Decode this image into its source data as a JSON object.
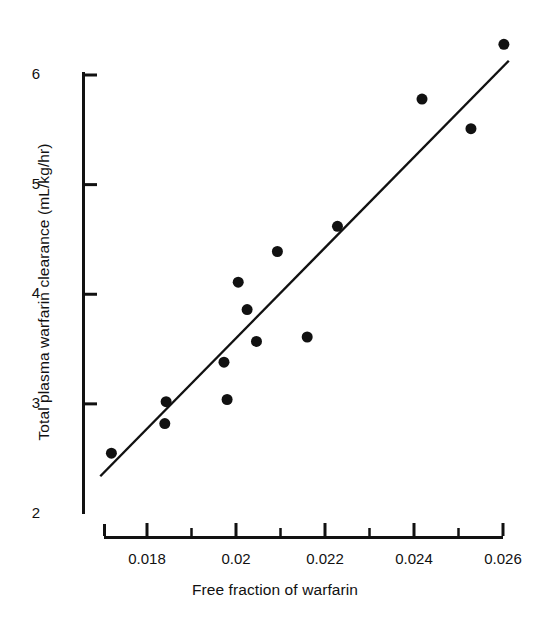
{
  "chart_data": {
    "type": "scatter",
    "title": "",
    "xlabel": "Free fraction of warfarin",
    "ylabel": "Total plasma warfarin clearance (mL/kg/hr)",
    "xlim": [
      0.0168,
      0.0262
    ],
    "ylim": [
      2.0,
      6.4
    ],
    "grid": false,
    "legend": null,
    "x_major_ticks": [
      0.018,
      0.02,
      0.022,
      0.024,
      0.026
    ],
    "x_major_tick_labels": [
      "0.018",
      "0.02",
      "0.022",
      "0.024",
      "0.026"
    ],
    "x_minor_ticks": [
      0.019,
      0.021,
      0.023,
      0.025
    ],
    "y_major_ticks": [
      2,
      3,
      4,
      5,
      6
    ],
    "y_major_tick_labels": [
      "2",
      "3",
      "4",
      "5",
      "6"
    ],
    "marker": "filled-circle",
    "marker_color": "#111111",
    "marker_size_px": 11,
    "line_color": "#111111",
    "points": [
      {
        "x": 0.0172,
        "y": 2.55
      },
      {
        "x": 0.01843,
        "y": 3.02
      },
      {
        "x": 0.0184,
        "y": 2.82
      },
      {
        "x": 0.01973,
        "y": 3.38
      },
      {
        "x": 0.0198,
        "y": 3.04
      },
      {
        "x": 0.02005,
        "y": 4.11
      },
      {
        "x": 0.02025,
        "y": 3.86
      },
      {
        "x": 0.02046,
        "y": 3.57
      },
      {
        "x": 0.02093,
        "y": 4.39
      },
      {
        "x": 0.0216,
        "y": 3.61
      },
      {
        "x": 0.02228,
        "y": 4.62
      },
      {
        "x": 0.02418,
        "y": 5.78
      },
      {
        "x": 0.02528,
        "y": 5.51
      },
      {
        "x": 0.02602,
        "y": 6.28
      }
    ],
    "fit_line": {
      "type": "linear-regression",
      "x_start": 0.01695,
      "y_start": 2.34,
      "x_end": 0.02613,
      "y_end": 6.13
    }
  },
  "axes": {
    "x_tick_label_y_px": 550,
    "y_tick_label_x_px": 40
  }
}
